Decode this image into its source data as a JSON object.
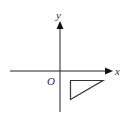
{
  "diagram": {
    "type": "coordinate-axes",
    "x_axis_label": "x",
    "y_axis_label": "y",
    "origin_label": "O",
    "shape": {
      "kind": "right-triangle",
      "quadrant": "IV",
      "description": "right triangle with right angle at top-left, located below the x-axis and to the right of the y-axis"
    },
    "colors": {
      "axis": "#222222",
      "shape_stroke": "#333333",
      "label": "#333333"
    }
  }
}
